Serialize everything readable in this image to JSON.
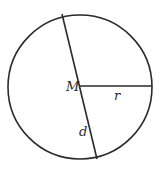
{
  "diagram": {
    "type": "circle-geometry",
    "circle": {
      "cx": 80,
      "cy": 87,
      "r": 72,
      "stroke": "#2a2a2a"
    },
    "diameter": {
      "x1": 62,
      "y1": 14,
      "x2": 97,
      "y2": 159
    },
    "radius": {
      "x1": 80,
      "y1": 86,
      "x2": 152,
      "y2": 86
    },
    "labels": {
      "center": "M",
      "radius": "r",
      "diameter": "d"
    }
  }
}
